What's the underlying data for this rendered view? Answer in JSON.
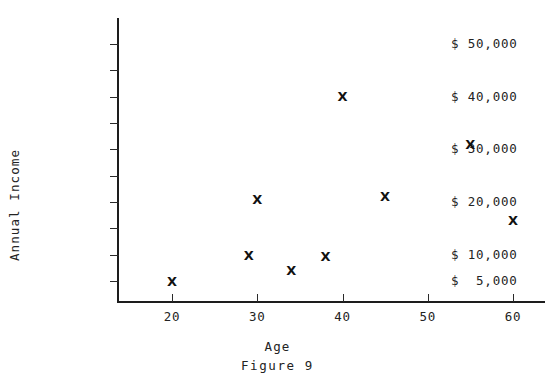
{
  "figure": {
    "caption": "Figure 9",
    "x_axis_title": "Age",
    "y_axis_title": "Annual Income",
    "marker_glyph": "X",
    "ink_color": "#1d1d1d",
    "background_color": "#ffffff"
  },
  "chart_data": {
    "type": "scatter",
    "title": "",
    "subtitle": "Figure 9",
    "xlabel": "Age",
    "ylabel": "Annual Income",
    "xlim": [
      16,
      66
    ],
    "ylim": [
      0,
      55000
    ],
    "grid": false,
    "legend": null,
    "x_ticks": [
      {
        "value": 20,
        "label": "20"
      },
      {
        "value": 30,
        "label": "30"
      },
      {
        "value": 40,
        "label": "40"
      },
      {
        "value": 50,
        "label": "50"
      },
      {
        "value": 60,
        "label": "60"
      }
    ],
    "y_ticks": [
      {
        "value": 50000,
        "label": "$ 50,000"
      },
      {
        "value": 45000,
        "label": ""
      },
      {
        "value": 40000,
        "label": "$ 40,000"
      },
      {
        "value": 35000,
        "label": ""
      },
      {
        "value": 30000,
        "label": "$ 30,000"
      },
      {
        "value": 25000,
        "label": ""
      },
      {
        "value": 20000,
        "label": "$ 20,000"
      },
      {
        "value": 15000,
        "label": ""
      },
      {
        "value": 10000,
        "label": "$ 10,000"
      },
      {
        "value": 5000,
        "label": "$  5,000"
      }
    ],
    "points": [
      {
        "x": 20,
        "y": 5000
      },
      {
        "x": 29,
        "y": 9800
      },
      {
        "x": 30,
        "y": 20500
      },
      {
        "x": 34,
        "y": 7000
      },
      {
        "x": 38,
        "y": 9700
      },
      {
        "x": 40,
        "y": 40000
      },
      {
        "x": 45,
        "y": 21000
      },
      {
        "x": 55,
        "y": 31000
      },
      {
        "x": 60,
        "y": 16500
      }
    ]
  }
}
